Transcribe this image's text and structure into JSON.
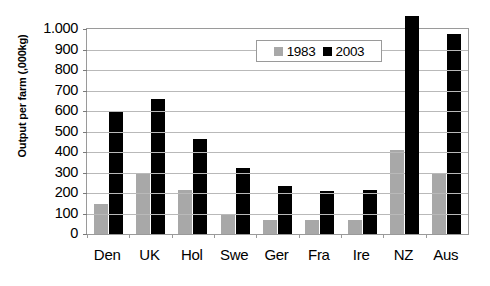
{
  "chart_data": {
    "type": "bar",
    "title": "",
    "subtitle": "",
    "xlabel": "",
    "ylabel": "Output per farm (,000kg)",
    "categories": [
      "Den",
      "UK",
      "Hol",
      "Swe",
      "Ger",
      "Fra",
      "Ire",
      "NZ",
      "Aus"
    ],
    "series": [
      {
        "name": "1983",
        "color": "#a8a8a8",
        "values": [
          145,
          300,
          215,
          95,
          70,
          68,
          70,
          410,
          300
        ]
      },
      {
        "name": "2003",
        "color": "#000000",
        "values": [
          598,
          660,
          465,
          320,
          235,
          210,
          215,
          1065,
          975
        ]
      }
    ],
    "ylim": [
      0,
      1000
    ],
    "ytick_values": [
      1000,
      900,
      800,
      700,
      600,
      500,
      400,
      300,
      200,
      100,
      0
    ],
    "ytick_labels": [
      "1.000",
      "900",
      "800",
      "700",
      "600",
      "500",
      "400",
      "300",
      "200",
      "100",
      "0"
    ],
    "grid": true,
    "legend_position": "top-right",
    "legend_entries": [
      "1983",
      "2003"
    ]
  },
  "axis": {
    "y_title": "Output per farm (,000kg)"
  },
  "legend": {
    "items": [
      {
        "label": "1983",
        "swatch": "gray-square-icon"
      },
      {
        "label": "2003",
        "swatch": "black-square-icon"
      }
    ]
  },
  "colors": {
    "series_1983": "#a8a8a8",
    "series_2003": "#000000",
    "gridline": "#b9b9b9",
    "axis": "#9a9a9a",
    "background": "#ffffff"
  }
}
